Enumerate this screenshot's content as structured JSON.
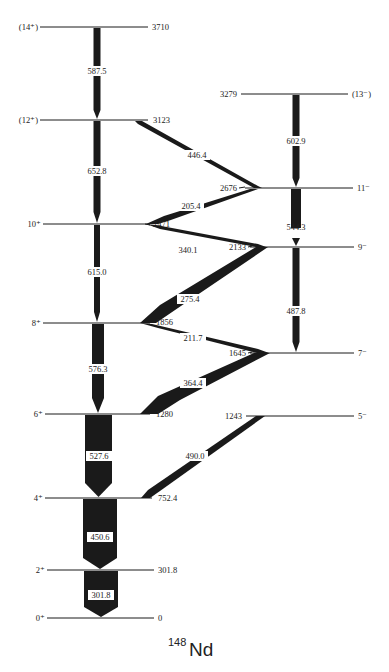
{
  "nucleus": {
    "mass": "148",
    "symbol": "Nd"
  },
  "colors": {
    "ink": "#1a1a1a",
    "background": "#ffffff"
  },
  "levels": [
    {
      "id": "L3710",
      "band": "gsb",
      "spin": "(14⁺)",
      "energy": "3710",
      "y": 27
    },
    {
      "id": "L3123",
      "band": "gsb",
      "spin": "(12⁺)",
      "energy": "3123",
      "y": 120
    },
    {
      "id": "L2471",
      "band": "gsb",
      "spin": "10⁺",
      "energy": "2471",
      "y": 224
    },
    {
      "id": "L1856",
      "band": "gsb",
      "spin": "8⁺",
      "energy": "1856",
      "y": 323
    },
    {
      "id": "L1280",
      "band": "gsb",
      "spin": "6⁺",
      "energy": "1280",
      "y": 414
    },
    {
      "id": "L752",
      "band": "gsb",
      "spin": "4⁺",
      "energy": "752.4",
      "y": 498
    },
    {
      "id": "L302",
      "band": "gsb",
      "spin": "2⁺",
      "energy": "301.8",
      "y": 570
    },
    {
      "id": "L0",
      "band": "gsb",
      "spin": "0⁺",
      "energy": "0",
      "y": 618
    },
    {
      "id": "L3279",
      "band": "neg",
      "spin": "(13⁻)",
      "energy": "3279",
      "y": 94
    },
    {
      "id": "L2676",
      "band": "neg",
      "spin": "11⁻",
      "energy": "2676",
      "y": 188
    },
    {
      "id": "L2133",
      "band": "neg",
      "spin": "9⁻",
      "energy": "2133",
      "y": 247
    },
    {
      "id": "L1645",
      "band": "neg",
      "spin": "7⁻",
      "energy": "1645",
      "y": 353
    },
    {
      "id": "L1243",
      "band": "neg",
      "spin": "5⁻",
      "energy": "1243",
      "y": 416
    }
  ],
  "transitions": [
    {
      "energy": "587.5",
      "from": "L3710",
      "to": "L3123",
      "type": "vertical",
      "width": 7
    },
    {
      "energy": "652.8",
      "from": "L3123",
      "to": "L2471",
      "type": "vertical",
      "width": 7
    },
    {
      "energy": "615.0",
      "from": "L2471",
      "to": "L1856",
      "type": "vertical",
      "width": 6
    },
    {
      "energy": "576.3",
      "from": "L1856",
      "to": "L1280",
      "type": "vertical",
      "width": 12
    },
    {
      "energy": "527.6",
      "from": "L1280",
      "to": "L752",
      "type": "vertical",
      "width": 27
    },
    {
      "energy": "450.6",
      "from": "L752",
      "to": "L302",
      "type": "vertical",
      "width": 34
    },
    {
      "energy": "301.8",
      "from": "L302",
      "to": "L0",
      "type": "vertical",
      "width": 34
    },
    {
      "energy": "602.9",
      "from": "L3279",
      "to": "L2676",
      "type": "vertical",
      "width": 7
    },
    {
      "energy": "544.3",
      "from": "L2676",
      "to": "L2133",
      "type": "vertical",
      "width": 10
    },
    {
      "energy": "487.8",
      "from": "L2133",
      "to": "L1645",
      "type": "vertical",
      "width": 7
    },
    {
      "energy": "446.4",
      "from": "L3123",
      "to": "L2676",
      "type": "diagonal",
      "width": 5
    },
    {
      "energy": "205.4",
      "from": "L2676",
      "to": "L2471",
      "type": "diagonal",
      "width": 6
    },
    {
      "energy": "340.1",
      "from": "L2471",
      "to": "L2133",
      "type": "diagonal",
      "width": 6
    },
    {
      "energy": "275.4",
      "from": "L2133",
      "to": "L1856",
      "type": "diagonal",
      "width": 12
    },
    {
      "energy": "211.7",
      "from": "L1856",
      "to": "L1645",
      "type": "diagonal",
      "width": 7
    },
    {
      "energy": "364.4",
      "from": "L1645",
      "to": "L1280",
      "type": "diagonal",
      "width": 14
    },
    {
      "energy": "490.0",
      "from": "L1243",
      "to": "L752",
      "type": "diagonal",
      "width": 7
    }
  ]
}
